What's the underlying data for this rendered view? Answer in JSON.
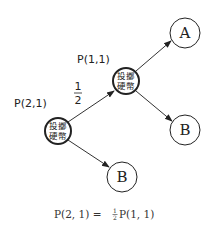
{
  "diagram": {
    "nodes": {
      "root": {
        "line1": "投擲",
        "line2": "硬幣",
        "label": "P(2,1)"
      },
      "middle": {
        "line1": "投擲",
        "line2": "硬幣",
        "label": "P(1,1)"
      },
      "a": {
        "text": "A"
      },
      "b_right": {
        "text": "B"
      },
      "b_bottom": {
        "text": "B"
      }
    },
    "edge_label": {
      "numerator": "1",
      "denominator": "2"
    },
    "equation": {
      "lhs": "P(2, 1) = ",
      "frac_num": "1",
      "frac_den": "2",
      "rhs": "P(1, 1)"
    },
    "colors": {
      "line": "#222222",
      "text": "#222222"
    }
  }
}
